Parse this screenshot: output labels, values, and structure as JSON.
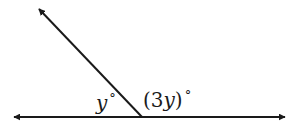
{
  "diagram": {
    "type": "linear-pair-angles",
    "stroke_color": "#1a1a1a",
    "line": {
      "left_arrow": [
        12,
        117
      ],
      "right_arrow": [
        287,
        117
      ]
    },
    "vertex": [
      142,
      117
    ],
    "ray": {
      "tip": [
        37,
        7
      ]
    },
    "angles": [
      {
        "id": "left",
        "variable": "y",
        "prefix": "",
        "suffix": "",
        "degree_symbol": "°"
      },
      {
        "id": "right",
        "variable": "y",
        "prefix": "(3",
        "suffix": ")",
        "degree_symbol": "°"
      }
    ]
  }
}
